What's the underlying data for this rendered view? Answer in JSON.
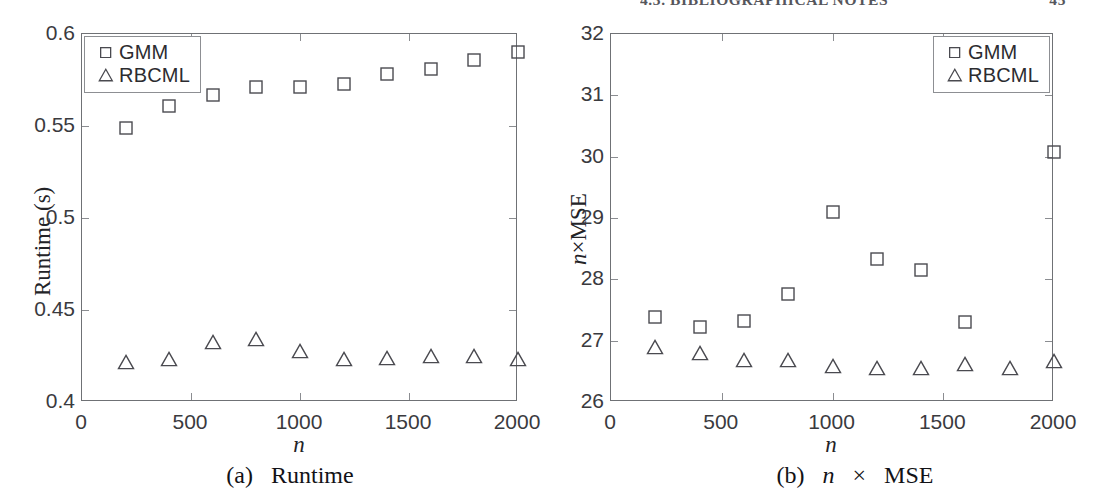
{
  "header": {
    "title": "4.3. BIBLIOGRAPHICAL NOTES",
    "page_number": "45"
  },
  "figure": {
    "panels": [
      {
        "id": "runtime",
        "caption_prefix": "(a)",
        "caption_text": "Runtime"
      },
      {
        "id": "nmse",
        "caption_prefix": "(b)",
        "caption_text": "MSE",
        "caption_var": "n",
        "caption_times": "×"
      }
    ]
  },
  "chart_data": [
    {
      "type": "scatter",
      "id": "panel-a-runtime",
      "title": "(a) Runtime",
      "xlabel": "n",
      "ylabel": "Runtime (s)",
      "xlim": [
        0,
        2000
      ],
      "ylim": [
        0.4,
        0.6
      ],
      "xticks": [
        0,
        500,
        1000,
        1500,
        2000
      ],
      "xticklabels": [
        "0",
        "500",
        "1000",
        "1500",
        "2000"
      ],
      "yticks": [
        0.4,
        0.45,
        0.5,
        0.55,
        0.6
      ],
      "yticklabels": [
        "0.4",
        "0.45",
        "0.5",
        "0.55",
        "0.6"
      ],
      "grid": false,
      "legend_position": "upper left",
      "x": [
        200,
        400,
        600,
        800,
        1000,
        1200,
        1400,
        1600,
        1800,
        2000
      ],
      "series": [
        {
          "name": "GMM",
          "marker": "square",
          "values": [
            0.549,
            0.561,
            0.567,
            0.571,
            0.571,
            0.573,
            0.578,
            0.581,
            0.586,
            0.59
          ]
        },
        {
          "name": "RBCML",
          "marker": "triangle",
          "values": [
            0.4215,
            0.4235,
            0.4325,
            0.4345,
            0.4275,
            0.4235,
            0.424,
            0.425,
            0.4248,
            0.4235
          ]
        }
      ]
    },
    {
      "type": "scatter",
      "id": "panel-b-nmse",
      "title": "(b) n × MSE",
      "xlabel": "n",
      "ylabel": "n×MSE",
      "xlim": [
        0,
        2000
      ],
      "ylim": [
        26,
        32
      ],
      "xticks": [
        0,
        500,
        1000,
        1500,
        2000
      ],
      "xticklabels": [
        "0",
        "500",
        "1000",
        "1500",
        "2000"
      ],
      "yticks": [
        26,
        27,
        28,
        29,
        30,
        31,
        32
      ],
      "yticklabels": [
        "26",
        "27",
        "28",
        "29",
        "30",
        "31",
        "32"
      ],
      "grid": false,
      "legend_position": "upper right",
      "x": [
        200,
        400,
        600,
        800,
        1000,
        1200,
        1400,
        1600,
        1800,
        2000
      ],
      "series": [
        {
          "name": "GMM",
          "marker": "square",
          "values": [
            27.38,
            27.22,
            27.32,
            27.76,
            29.1,
            28.33,
            28.16,
            27.31,
            null,
            30.08
          ]
        },
        {
          "name": "RBCML",
          "marker": "triangle",
          "values": [
            26.9,
            26.8,
            26.69,
            26.68,
            26.59,
            26.55,
            26.55,
            26.62,
            26.55,
            26.67
          ]
        }
      ]
    }
  ],
  "legend": {
    "entries": [
      {
        "label": "GMM",
        "marker": "square"
      },
      {
        "label": "RBCML",
        "marker": "triangle"
      }
    ]
  },
  "colors": {
    "axis": "#6f7175",
    "tick": "#8b8d91",
    "marker_stroke": "#4a4a50",
    "text": "#1a1a1a",
    "header_text": "#56565c"
  }
}
